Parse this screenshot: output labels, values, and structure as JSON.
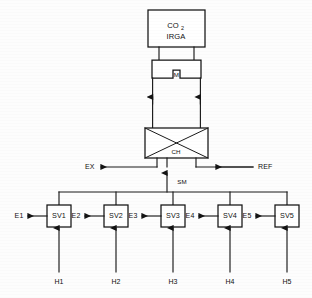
{
  "diagram": {
    "analyzer": {
      "label_main": "CO",
      "label_subscript": "2",
      "label_second": "IRGA"
    },
    "chamber": {
      "label": "M"
    },
    "crossover": {
      "label": "CH"
    },
    "ports": {
      "exhaust": "EX",
      "reference": "REF",
      "sample": "SM"
    },
    "valves": [
      {
        "name": "SV1",
        "outlet": "E1",
        "inlet": "H1"
      },
      {
        "name": "SV2",
        "outlet": "E2",
        "inlet": "H2"
      },
      {
        "name": "SV3",
        "outlet": "E3",
        "inlet": "H3"
      },
      {
        "name": "SV4",
        "outlet": "E4",
        "inlet": "H4"
      },
      {
        "name": "SV5",
        "outlet": "E5",
        "inlet": "H5"
      }
    ],
    "colors": {
      "line": "#1a1a1a",
      "fill": "#ffffff",
      "background": "#fdfdfd"
    }
  }
}
